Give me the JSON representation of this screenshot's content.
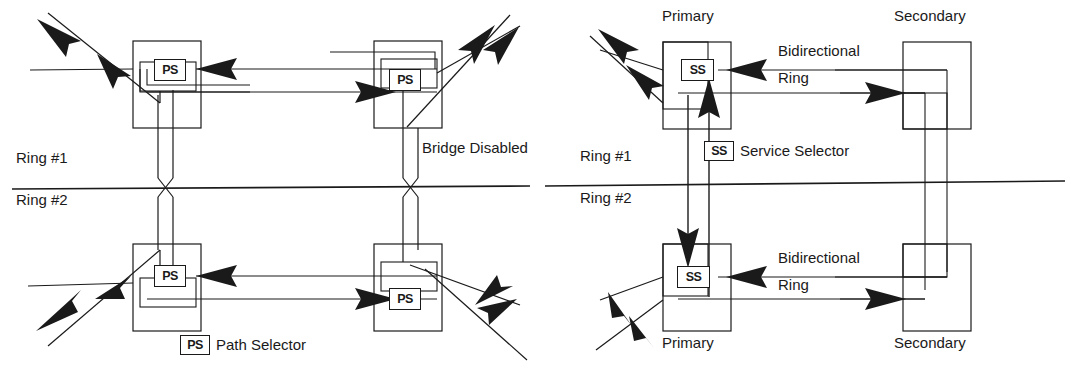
{
  "figure": {
    "type": "network-topology-diagram",
    "background": "#ffffff",
    "line_color": "#1a1a1a",
    "panels": [
      {
        "id": "left-panel",
        "name": "path-selector-dual-ring",
        "ring_labels": {
          "upper": "Ring #1",
          "lower": "Ring #2"
        },
        "annotation": "Bridge Disabled",
        "legend": {
          "symbol": "PS",
          "text": "Path Selector"
        },
        "nodes": [
          {
            "id": "ps-top-left",
            "symbol": "PS"
          },
          {
            "id": "ps-top-right",
            "symbol": "PS"
          },
          {
            "id": "ps-bottom-left",
            "symbol": "PS"
          },
          {
            "id": "ps-bottom-right",
            "symbol": "PS"
          }
        ]
      },
      {
        "id": "right-panel",
        "name": "service-selector-bidirectional-ring",
        "ring_labels": {
          "upper": "Ring #1",
          "lower": "Ring #2"
        },
        "legend": {
          "symbol": "SS",
          "text": "Service Selector"
        },
        "nodes": [
          {
            "id": "ss-top-primary",
            "symbol": "SS",
            "label": "Primary",
            "label_position": "above"
          },
          {
            "id": "secondary-top",
            "label": "Secondary",
            "label_position": "above"
          },
          {
            "id": "ss-bottom-primary",
            "symbol": "SS",
            "label": "Primary",
            "label_position": "below"
          },
          {
            "id": "secondary-bottom",
            "label": "Secondary",
            "label_position": "below"
          }
        ],
        "link_labels": [
          {
            "id": "bidir-top",
            "line1": "Bidirectional",
            "line2": "Ring"
          },
          {
            "id": "bidir-bottom",
            "line1": "Bidirectional",
            "line2": "Ring"
          }
        ]
      }
    ]
  },
  "left": {
    "ring1": "Ring #1",
    "ring2": "Ring #2",
    "bridge_disabled": "Bridge Disabled",
    "legend_symbol": "PS",
    "legend_text": "Path Selector",
    "node_symbol": "PS"
  },
  "right": {
    "ring1": "Ring #1",
    "ring2": "Ring #2",
    "legend_symbol": "SS",
    "legend_text": "Service Selector",
    "node_symbol": "SS",
    "primary_top": "Primary",
    "primary_bottom": "Primary",
    "secondary_top": "Secondary",
    "secondary_bottom": "Secondary",
    "bidir_top_line1": "Bidirectional",
    "bidir_top_line2": "Ring",
    "bidir_bottom_line1": "Bidirectional",
    "bidir_bottom_line2": "Ring"
  }
}
